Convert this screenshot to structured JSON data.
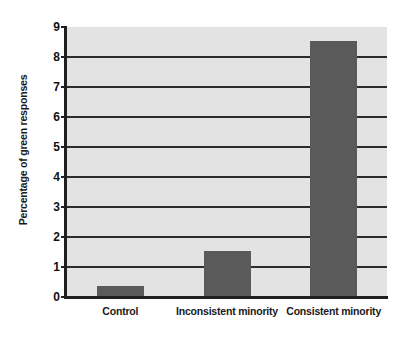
{
  "chart_data": {
    "type": "bar",
    "title": "",
    "subtitle": "",
    "xlabel": "",
    "ylabel": "Percentage of green responses",
    "categories": [
      "Control",
      "Inconsistent minority",
      "Consistent minority"
    ],
    "values": [
      0.37,
      1.55,
      8.55
    ],
    "series": [
      {
        "name": "Percentage of green responses",
        "values": [
          0.37,
          1.55,
          8.55
        ]
      }
    ],
    "ylim": [
      0,
      9
    ],
    "ytick_labels": [
      "0",
      "1",
      "2",
      "3",
      "4",
      "5",
      "6",
      "7",
      "8",
      "9"
    ],
    "ytick_values": [
      0,
      1,
      2,
      3,
      4,
      5,
      6,
      7,
      8,
      9
    ],
    "gridline_values": [
      1,
      2,
      3,
      4,
      5,
      6,
      7,
      8
    ],
    "grid": true,
    "legend": false,
    "legend_position": "none",
    "annotations": [],
    "colors": {
      "bar_fill": "#5a5a5a",
      "plot_background": "#e3e3e3",
      "figure_background": "#ffffff",
      "axis": "#1f1f1f",
      "gridline": "#2b2b2b",
      "text": "#1a1a1a"
    }
  }
}
